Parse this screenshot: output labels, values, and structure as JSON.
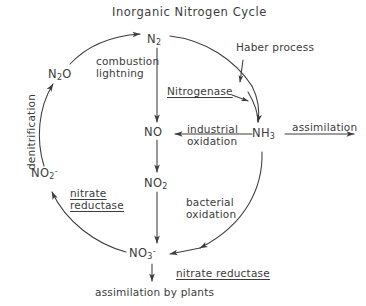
{
  "diagram": {
    "title": "Inorganic Nitrogen Cycle",
    "type": "cycle-diagram",
    "ink_color": "#3c3c3c",
    "background_color": "#ffffff",
    "species": [
      {
        "id": "n2",
        "label": "N2",
        "html": "N<sub>2</sub>",
        "x": 155,
        "y": 40
      },
      {
        "id": "n2o",
        "label": "N2O",
        "html": "N<sub>2</sub>O",
        "x": 62,
        "y": 75
      },
      {
        "id": "no",
        "label": "NO",
        "html": "NO",
        "x": 157,
        "y": 133
      },
      {
        "id": "nh3",
        "label": "NH3",
        "html": "NH<sub>3</sub>",
        "x": 262,
        "y": 135
      },
      {
        "id": "no2m",
        "label": "NO2-",
        "html": "NO<sub>2</sub><sup>-</sup>",
        "x": 45,
        "y": 175
      },
      {
        "id": "no2",
        "label": "NO2",
        "html": "NO<sub>2</sub>",
        "x": 157,
        "y": 184
      },
      {
        "id": "no3m",
        "label": "NO3-",
        "html": "NO<sub>3</sub><sup>-</sup>",
        "x": 144,
        "y": 255
      }
    ],
    "processes": [
      {
        "id": "combustion-lightning",
        "lines": [
          "combustion",
          "lightning"
        ],
        "style": "plain"
      },
      {
        "id": "haber-process",
        "lines": [
          "Haber process"
        ],
        "style": "plain"
      },
      {
        "id": "nitrogenase",
        "lines": [
          "Nitrogenase"
        ],
        "style": "underlined"
      },
      {
        "id": "industrial-oxidation",
        "lines": [
          "industrial",
          "oxidation"
        ],
        "style": "plain"
      },
      {
        "id": "assimilation",
        "lines": [
          "assimilation"
        ],
        "style": "plain"
      },
      {
        "id": "denitrification",
        "lines": [
          "denitrification"
        ],
        "style": "rotated"
      },
      {
        "id": "nitrate-reductase-left",
        "lines": [
          "nitrate",
          "reductase"
        ],
        "style": "underlined"
      },
      {
        "id": "bacterial-oxidation",
        "lines": [
          "bacterial",
          "oxidation"
        ],
        "style": "plain"
      },
      {
        "id": "nitrate-reductase-bottom",
        "lines": [
          "nitrate reductase"
        ],
        "style": "underlined"
      },
      {
        "id": "assimilation-by-plants",
        "lines": [
          "assimilation by plants"
        ],
        "style": "plain"
      }
    ],
    "labels": {
      "title": "Inorganic Nitrogen Cycle",
      "combustion": "combustion",
      "lightning": "lightning",
      "haber_process": "Haber process",
      "nitrogenase": "Nitrogenase",
      "industrial": "industrial",
      "oxidation": "oxidation",
      "assimilation": "assimilation",
      "denitrification": "denitrification",
      "nitrate": "nitrate",
      "reductase": "reductase",
      "bacterial": "bacterial",
      "bacterial_oxidation": "oxidation",
      "nitrate_reductase": "nitrate reductase",
      "assimilation_by_plants": "assimilation by plants"
    },
    "reactions": [
      {
        "from": "N2O",
        "to": "N2",
        "label": "combustion / lightning",
        "path": "outer-left-upper"
      },
      {
        "from": "N2",
        "to": "NH3",
        "label": "Nitrogenase",
        "path": "outer-right-upper"
      },
      {
        "from": "N2",
        "to": "NH3",
        "label": "Haber process",
        "path": "outer-right-upper-2"
      },
      {
        "from": "N2",
        "to": "NO",
        "label": "",
        "path": "center-vertical"
      },
      {
        "from": "NH3",
        "to": "NO",
        "label": "industrial oxidation",
        "path": "horizontal-left"
      },
      {
        "from": "NH3",
        "to": "external",
        "label": "assimilation",
        "path": "horizontal-right"
      },
      {
        "from": "NO",
        "to": "NO2",
        "label": "",
        "path": "center-vertical"
      },
      {
        "from": "NO2",
        "to": "NO3-",
        "label": "",
        "path": "center-vertical"
      },
      {
        "from": "NH3",
        "to": "NO3-",
        "label": "bacterial oxidation",
        "path": "outer-right-lower"
      },
      {
        "from": "NO3-",
        "to": "NO2-",
        "label": "nitrate reductase",
        "path": "outer-left-lower"
      },
      {
        "from": "NO2-",
        "to": "N2O",
        "label": "denitrification",
        "path": "outer-left-middle"
      },
      {
        "from": "NO3-",
        "to": "external",
        "label": "assimilation by plants / nitrate reductase",
        "path": "down"
      }
    ]
  }
}
